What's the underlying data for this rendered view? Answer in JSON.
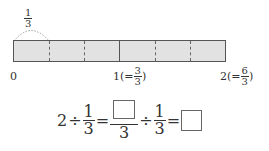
{
  "diagram": {
    "segment_label": {
      "num": "1",
      "den": "3"
    },
    "bar": {
      "color": "#e2e2e2",
      "total_units": 6,
      "major_divisions": 2
    },
    "ticks": [
      {
        "label": "0"
      },
      {
        "label": "1",
        "equiv_num": "3",
        "equiv_den": "3"
      },
      {
        "label": "2",
        "equiv_num": "6",
        "equiv_den": "3"
      }
    ]
  },
  "equation": {
    "lhs_whole": "2",
    "op1": "÷",
    "frac1": {
      "num": "1",
      "den": "3"
    },
    "eq1": "=",
    "frac2": {
      "num": "",
      "den": "3"
    },
    "op2": "÷",
    "frac3": {
      "num": "1",
      "den": "3"
    },
    "eq2": "=",
    "answer": ""
  }
}
